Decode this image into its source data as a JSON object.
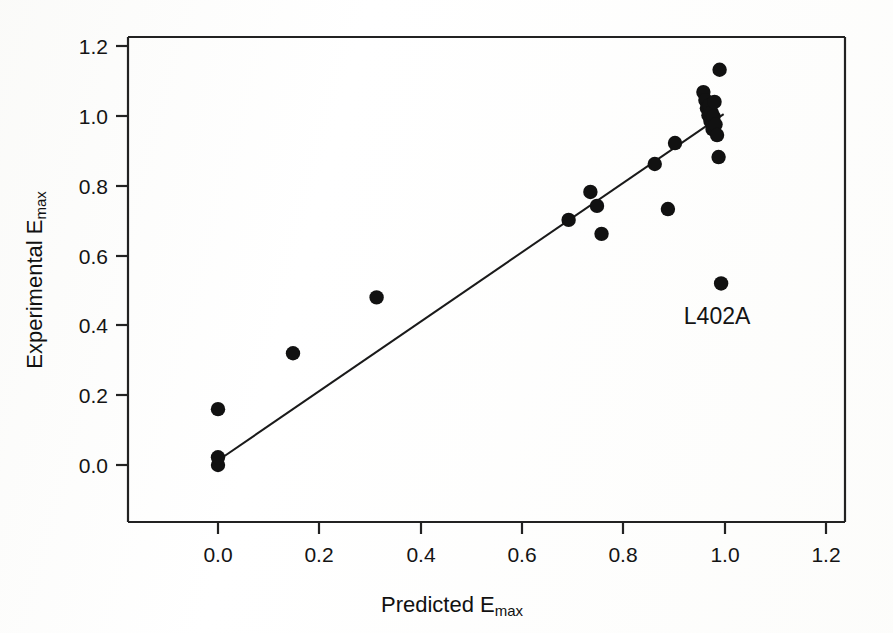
{
  "chart_data": {
    "type": "scatter",
    "title": "",
    "xlabel": "Predicted Emax",
    "xlabel_base": "Predicted E",
    "xlabel_sub": "max",
    "ylabel": "Experimental Emax",
    "ylabel_base": "Experimental E",
    "ylabel_sub": "max",
    "xlim": [
      -0.18,
      1.3
    ],
    "ylim": [
      -0.12,
      1.28
    ],
    "xticks": [
      0.0,
      0.2,
      0.4,
      0.6,
      0.8,
      1.0,
      1.2
    ],
    "xticklabels": [
      "0.0",
      "0.2",
      "0.4",
      "0.6",
      "0.8",
      "1.0",
      "1.2"
    ],
    "yticks": [
      0.0,
      0.2,
      0.4,
      0.6,
      0.8,
      1.0,
      1.2
    ],
    "yticklabels": [
      "0.0",
      "0.2",
      "0.4",
      "0.6",
      "0.8",
      "1.0",
      "1.2"
    ],
    "grid": false,
    "legend": false,
    "marker": "filled-circle",
    "marker_color": "#111111",
    "marker_size": 7.2,
    "line_color": "#1a1a1a",
    "frame_color": "#222222",
    "points": [
      {
        "x": 0.0,
        "y": 0.0
      },
      {
        "x": 0.0,
        "y": 0.022
      },
      {
        "x": 0.0,
        "y": 0.16
      },
      {
        "x": 0.148,
        "y": 0.32
      },
      {
        "x": 0.313,
        "y": 0.48
      },
      {
        "x": 0.692,
        "y": 0.702
      },
      {
        "x": 0.735,
        "y": 0.782
      },
      {
        "x": 0.748,
        "y": 0.742
      },
      {
        "x": 0.757,
        "y": 0.662
      },
      {
        "x": 0.862,
        "y": 0.862
      },
      {
        "x": 0.888,
        "y": 0.733
      },
      {
        "x": 0.902,
        "y": 0.922
      },
      {
        "x": 0.958,
        "y": 1.068
      },
      {
        "x": 0.962,
        "y": 1.045
      },
      {
        "x": 0.965,
        "y": 1.022
      },
      {
        "x": 0.968,
        "y": 1.002
      },
      {
        "x": 0.97,
        "y": 1.03
      },
      {
        "x": 0.972,
        "y": 0.985
      },
      {
        "x": 0.974,
        "y": 1.01
      },
      {
        "x": 0.976,
        "y": 0.962
      },
      {
        "x": 0.978,
        "y": 0.998
      },
      {
        "x": 0.98,
        "y": 1.04
      },
      {
        "x": 0.982,
        "y": 0.975
      },
      {
        "x": 0.985,
        "y": 0.945
      },
      {
        "x": 0.988,
        "y": 0.882
      },
      {
        "x": 0.99,
        "y": 1.132
      },
      {
        "x": 0.993,
        "y": 0.52
      }
    ],
    "fit_line": {
      "x0": 0.005,
      "y0": 0.018,
      "x1": 0.998,
      "y1": 1.005
    },
    "annotations": [
      {
        "text": "L402A",
        "x": 0.985,
        "y": 0.405,
        "anchor": "middle"
      }
    ]
  },
  "axes": {
    "x_tick_label_0": "0.0",
    "x_tick_label_1": "0.2",
    "x_tick_label_2": "0.4",
    "x_tick_label_3": "0.6",
    "x_tick_label_4": "0.8",
    "x_tick_label_5": "1.0",
    "x_tick_label_6": "1.2",
    "y_tick_label_0": "0.0",
    "y_tick_label_1": "0.2",
    "y_tick_label_2": "0.4",
    "y_tick_label_3": "0.6",
    "y_tick_label_4": "0.8",
    "y_tick_label_5": "1.0",
    "y_tick_label_6": "1.2"
  }
}
